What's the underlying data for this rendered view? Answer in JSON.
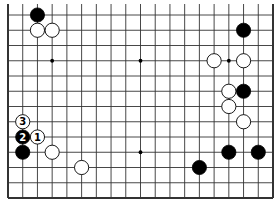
{
  "diagram": {
    "type": "go-board",
    "board_size": 19,
    "visible_rows": 13,
    "view": "bottom 13 rows of 19x19 board (top cut off)",
    "colors": {
      "background": "#ffffff",
      "line": "#333333",
      "black_stone": "#000000",
      "white_stone": "#ffffff"
    },
    "star_points": [
      {
        "col": 3,
        "row": 3
      },
      {
        "col": 9,
        "row": 3
      },
      {
        "col": 15,
        "row": 3
      },
      {
        "col": 3,
        "row": 9
      },
      {
        "col": 9,
        "row": 9
      },
      {
        "col": 15,
        "row": 9
      }
    ],
    "stones": [
      {
        "color": "black",
        "col": 2,
        "row": 0,
        "label": ""
      },
      {
        "color": "white",
        "col": 2,
        "row": 1,
        "label": ""
      },
      {
        "color": "white",
        "col": 3,
        "row": 1,
        "label": ""
      },
      {
        "color": "black",
        "col": 16,
        "row": 1,
        "label": ""
      },
      {
        "color": "white",
        "col": 14,
        "row": 3,
        "label": ""
      },
      {
        "color": "white",
        "col": 16,
        "row": 3,
        "label": ""
      },
      {
        "color": "white",
        "col": 15,
        "row": 5,
        "label": ""
      },
      {
        "color": "black",
        "col": 16,
        "row": 5,
        "label": ""
      },
      {
        "color": "white",
        "col": 15,
        "row": 6,
        "label": ""
      },
      {
        "color": "white",
        "col": 16,
        "row": 7,
        "label": ""
      },
      {
        "color": "white",
        "col": 1,
        "row": 7,
        "label": "3"
      },
      {
        "color": "black",
        "col": 1,
        "row": 8,
        "label": "2"
      },
      {
        "color": "white",
        "col": 2,
        "row": 8,
        "label": "1"
      },
      {
        "color": "black",
        "col": 1,
        "row": 9,
        "label": ""
      },
      {
        "color": "white",
        "col": 3,
        "row": 9,
        "label": ""
      },
      {
        "color": "black",
        "col": 15,
        "row": 9,
        "label": ""
      },
      {
        "color": "black",
        "col": 17,
        "row": 9,
        "label": ""
      },
      {
        "color": "black",
        "col": 13,
        "row": 10,
        "label": ""
      },
      {
        "color": "white",
        "col": 5,
        "row": 10,
        "label": ""
      }
    ]
  }
}
